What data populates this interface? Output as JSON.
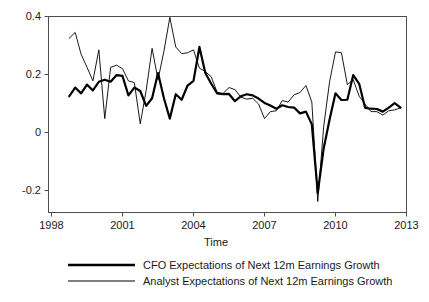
{
  "chart_data": {
    "type": "line",
    "title": "",
    "xlabel": "Time",
    "ylabel": "",
    "xlim": [
      1998,
      2013
    ],
    "ylim": [
      -0.28,
      0.41
    ],
    "grid": false,
    "legend_position": "bottom",
    "xticks": [
      "1998",
      "2001",
      "2004",
      "2007",
      "2010",
      "2013"
    ],
    "xtick_values": [
      1998,
      2001,
      2004,
      2007,
      2010,
      2013
    ],
    "yticks": [
      "0.4",
      "0.2",
      "0",
      "-0.2"
    ],
    "ytick_values": [
      0.4,
      0.2,
      0.0,
      -0.2
    ],
    "x": [
      1998.75,
      1999.0,
      1999.25,
      1999.5,
      1999.75,
      2000.0,
      2000.25,
      2000.5,
      2000.75,
      2001.0,
      2001.25,
      2001.5,
      2001.75,
      2002.0,
      2002.25,
      2002.5,
      2002.75,
      2003.0,
      2003.25,
      2003.5,
      2003.75,
      2004.0,
      2004.25,
      2004.5,
      2004.75,
      2005.0,
      2005.25,
      2005.5,
      2005.75,
      2006.0,
      2006.25,
      2006.5,
      2006.75,
      2007.0,
      2007.25,
      2007.5,
      2007.75,
      2008.0,
      2008.25,
      2008.5,
      2008.75,
      2009.0,
      2009.25,
      2009.5,
      2009.75,
      2010.0,
      2010.25,
      2010.5,
      2010.75,
      2011.0,
      2011.25,
      2011.5,
      2011.75,
      2012.0,
      2012.25,
      2012.5,
      2012.75
    ],
    "series": [
      {
        "name": "CFO Expectations of Next 12m Earnings Growth",
        "style": "thick",
        "values": [
          0.125,
          0.155,
          0.135,
          0.165,
          0.145,
          0.175,
          0.182,
          0.175,
          0.198,
          0.195,
          0.128,
          0.155,
          0.143,
          0.092,
          0.118,
          0.205,
          0.118,
          0.048,
          0.132,
          0.113,
          0.162,
          0.178,
          0.295,
          0.205,
          0.168,
          0.135,
          0.132,
          0.133,
          0.108,
          0.125,
          0.132,
          0.128,
          0.117,
          0.102,
          0.093,
          0.082,
          0.094,
          0.088,
          0.086,
          0.066,
          0.072,
          0.028,
          -0.208,
          -0.055,
          0.045,
          0.135,
          0.112,
          0.113,
          0.198,
          0.168,
          0.085,
          0.082,
          0.081,
          0.072,
          0.086,
          0.101,
          0.086
        ]
      },
      {
        "name": "Analyst Expectations of Next 12m Earnings Growth",
        "style": "thin",
        "values": [
          0.325,
          0.345,
          0.27,
          0.225,
          0.178,
          0.285,
          0.048,
          0.225,
          0.232,
          0.22,
          0.178,
          0.172,
          0.03,
          0.145,
          0.29,
          0.182,
          0.28,
          0.397,
          0.295,
          0.272,
          0.275,
          0.285,
          0.222,
          0.21,
          0.192,
          0.138,
          0.135,
          0.155,
          0.148,
          0.122,
          0.115,
          0.118,
          0.098,
          0.048,
          0.072,
          0.075,
          0.11,
          0.105,
          0.13,
          0.138,
          0.162,
          0.105,
          -0.238,
          0.02,
          0.175,
          0.278,
          0.275,
          0.165,
          0.182,
          0.125,
          0.098,
          0.072,
          0.072,
          0.06,
          0.075,
          0.078,
          0.085
        ]
      }
    ]
  },
  "legend": {
    "items": [
      {
        "label": "CFO Expectations of Next 12m Earnings Growth"
      },
      {
        "label": "Analyst Expectations of Next 12m Earnings Growth"
      }
    ]
  },
  "axes": {
    "x_title": "Time"
  }
}
